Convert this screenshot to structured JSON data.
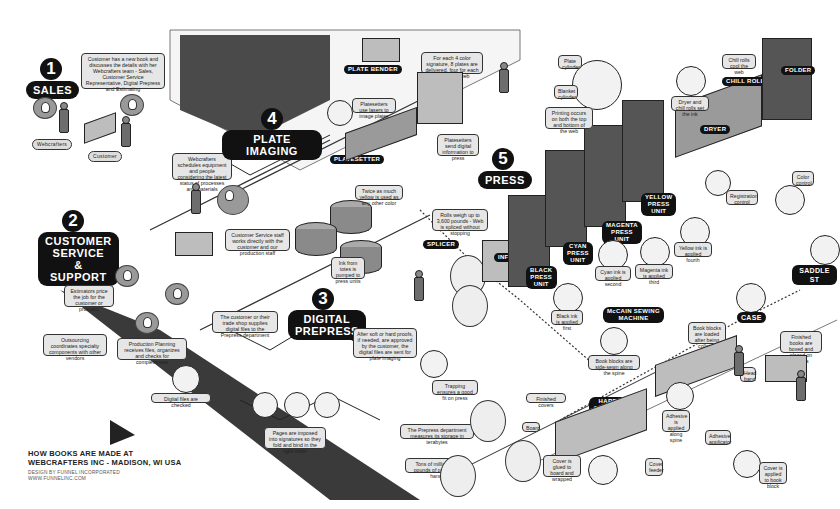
{
  "title": {
    "line1": "HOW BOOKS ARE MADE AT",
    "line2": "WEBCRAFTERS INC - MADISON, WI USA"
  },
  "credit": {
    "line1": "DESIGN BY FUNNEL INCORPORATED",
    "line2": "WWW.FUNNELINC.COM"
  },
  "steps": [
    {
      "num": "1",
      "label": "SALES"
    },
    {
      "num": "2",
      "label": "CUSTOMER\nSERVICE\n& SUPPORT"
    },
    {
      "num": "3",
      "label": "DIGITAL\nPREPRESS"
    },
    {
      "num": "4",
      "label": "PLATE IMAGING"
    },
    {
      "num": "5",
      "label": "PRESS"
    }
  ],
  "tags": {
    "webcrafters": "Webcrafters",
    "customer": "Customer",
    "plate_bender": "PLATE BENDER",
    "platesetter": "PLATESETTER",
    "splicer": "SPLICER",
    "infeed": "INFEED",
    "black_unit": "BLACK\nPRESS\nUNIT",
    "cyan_unit": "CYAN\nPRESS\nUNIT",
    "magenta_unit": "MAGENTA\nPRESS\nUNIT",
    "yellow_unit": "YELLOW\nPRESS\nUNIT",
    "dryer": "DRYER",
    "chill_rolls": "CHILL ROLLS",
    "folder": "FOLDER",
    "mccain": "McCAIN SEWING\nMACHINE",
    "case": "CASE",
    "saddle": "SADDLE ST",
    "hardback": "HARDBACK\n& CASEBOUND\nCOVER MAKER",
    "finished_covers": "Finished covers",
    "board": "Board",
    "head_band": "Head band",
    "cover_feeder": "Cover feeder",
    "adhesive_applicator": "Adhesive applicator",
    "registration_control": "Registration control",
    "color_control": "Color control",
    "plate_cylinder": "Plate cylinder",
    "blanket_cylinder": "Blanket cylinder"
  },
  "callouts": {
    "sales_desc": "Customer has a new book and discusses the details with her Webcrafters team - Sales, Customer Service Representative, Digital Prepress and Estimating",
    "schedules": "Webcrafters schedules equipment and people considering the latest status of processes and materials",
    "cs_staff": "Customer Service staff works directly with the customer and our production staff",
    "estimators": "Estimators price the job for the customer or prospect",
    "outsourcing": "Outsourcing coordinates specialty components with other vendors",
    "production_planning": "Production Planning receives files, organizes and checks for completeness",
    "trade_shop": "The customer or their trade shop supplies digital files to the Prepress department",
    "digital_checked": "Digital files are checked",
    "pages_imposed": "Pages are imposed into signatures so they fold and bind in the right order",
    "proofs": "After soft or hard proofs, if needed, are approved by the customer, the digital files are sent for plate imaging",
    "trapping": "Trapping ensures a good fit on press",
    "paper_storage": "The Prepress department measures its storage in terabytes",
    "tons_paper": "Tons of millions of pounds of paper on hand",
    "yellow_twice": "Twice as much yellow is used as any other color",
    "ink_totes": "Ink from totes is pumped to press units",
    "platesetters_lasers": "Platesetters use lasers to image plates",
    "four_color": "For each 4 color signature, 8 plates are delivered, four for each side of the web",
    "platesetters_send": "Platesetters send digital information to press",
    "rolls_weigh": "Rolls weigh up to 3,600 pounds - Web is spliced without stopping",
    "black_ink": "Black ink is applied first",
    "cyan_ink": "Cyan ink is applied second",
    "magenta_ink": "Magenta ink is applied third",
    "yellow_ink": "Yellow ink is applied fourth",
    "printing_both": "Printing occurs on both the top and bottom of the web",
    "dryer_chill": "Dryer and chill rolls set the ink",
    "chill_cool": "Chill rolls cool the web",
    "sewn": "Book blocks are side-sewn along the spine",
    "book_blocks": "Book blocks are loaded after being collated",
    "finished_books": "Finished books are boxed and placed on pallets",
    "adhesive_spine": "Adhesive is applied along spine",
    "cover_glued": "Cover is glued to board and wrapped",
    "cover_applied": "Cover is applied to book block"
  },
  "ink_label": "ink",
  "colors": {
    "ink_black": "#111111",
    "callout_fill": "#e6e6e6",
    "floor_dark": "#3a3a3a",
    "machine_gray": "#8a8a8a"
  }
}
